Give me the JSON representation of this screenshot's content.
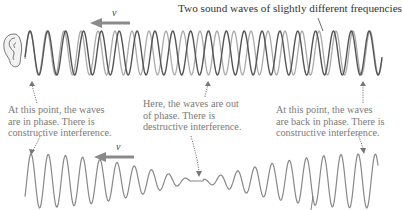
{
  "caption": "Two sound waves of slightly different frequencies",
  "velocity_label": "v",
  "notes": {
    "left": [
      "At this point, the waves",
      "are in phase. There is",
      "constructive interference."
    ],
    "middle": [
      "Here, the waves are out",
      "of phase. There is",
      "destructive interference."
    ],
    "right": [
      "At this point, the waves",
      "are back in phase. There is",
      "constructive interference."
    ]
  },
  "icons": {
    "ear": "ear-icon",
    "velocity_arrow": "arrow-left-icon"
  },
  "colors": {
    "wave_dark": "#555555",
    "wave_light": "#aaaaaa",
    "beat_wave": "#888888",
    "arrow": "#8a8a8a",
    "text_note": "#7a7a7a",
    "caption": "#333333"
  },
  "waves": {
    "wave_a_cycles": 20,
    "wave_b_cycles": 21,
    "beat_cycles_shown": 1
  }
}
